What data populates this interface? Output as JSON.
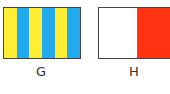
{
  "flags": [
    {
      "label": "G",
      "stripes": [
        "#ffee33",
        "#22aaee",
        "#ffee33",
        "#22aaee",
        "#ffee33",
        "#22aaee"
      ]
    },
    {
      "label": "H",
      "stripes": [
        "#ffffff",
        "#ff3311"
      ]
    }
  ]
}
